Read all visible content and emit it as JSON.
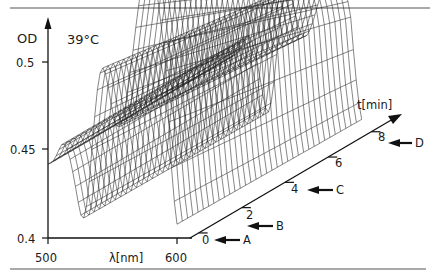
{
  "chart_data": {
    "type": "surface3d",
    "title": "",
    "annotation": "39°C",
    "ylabel": "OD",
    "xlabel": "λ[nm]",
    "zlabel": "t[min]",
    "y_ticks": [
      "0.4",
      "0.45",
      "0.5"
    ],
    "x_ticks": [
      "500",
      "600"
    ],
    "t_ticks": [
      "0",
      "2",
      "4",
      "6",
      "8"
    ],
    "ylim": [
      0.4,
      0.52
    ],
    "xlim": [
      500,
      600
    ],
    "tlim": [
      0,
      9
    ],
    "markers": [
      {
        "label": "A",
        "t": 0
      },
      {
        "label": "B",
        "t": 1
      },
      {
        "label": "C",
        "t": 4
      },
      {
        "label": "D",
        "t": 8
      }
    ]
  },
  "labels": {
    "od": "OD",
    "temp": "39°C",
    "y_05": "0.5",
    "y_045": "0.45",
    "y_04": "0.4",
    "x_500": "500",
    "x_unit": "λ[nm]",
    "x_600": "600",
    "t_unit": "t[min]",
    "t0": "0",
    "t2": "2",
    "t4": "4",
    "t6": "6",
    "t8": "8",
    "mA": "A",
    "mB": "B",
    "mC": "C",
    "mD": "D"
  }
}
